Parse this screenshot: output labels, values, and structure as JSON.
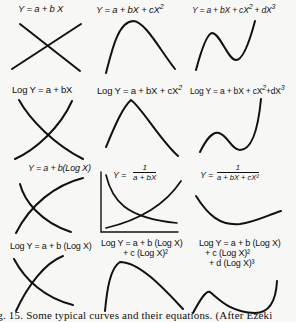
{
  "figure": {
    "caption": "ig. 15.  Some typical curves and their equations.  (After Ezeki",
    "rows": [
      {
        "panels": [
          {
            "equation": "Y = a + b X"
          },
          {
            "equation": "Y = a + bX + cX²"
          },
          {
            "equation": "Y = a + bX + cX² + dX³"
          }
        ]
      },
      {
        "panels": [
          {
            "equation": "Log Y = a + bX"
          },
          {
            "equation": "Log Y = a + bX + cX²"
          },
          {
            "equation": "Log Y = a + bX + cX² + dX³"
          }
        ]
      },
      {
        "panels": [
          {
            "equation": "Y = a + b(Log X)"
          },
          {
            "equation": "Y = 1 / (a + bX)",
            "numerator": "1",
            "denominator": "a + bX"
          },
          {
            "equation": "Y = 1 / (a + bX + cX²)",
            "numerator": "1",
            "denominator": "a + bX + cX²"
          }
        ]
      },
      {
        "panels": [
          {
            "equation": "Log Y = a + b (Log X)"
          },
          {
            "equation": "Log Y = a + b (Log X) + c (Log X)²",
            "line1": "Log Y = a + b (Log X)",
            "line2": "+ c (Log X)²"
          },
          {
            "equation": "Log Y = a + b (Log X) + c (Log X)² + d (Log X)³",
            "line1": "Log Y = a + b (Log X)",
            "line2": "+ c (Log X)²",
            "line3": "+ d (Log X)³"
          }
        ]
      }
    ]
  },
  "labels": {
    "r1p1": "Y = a + b  X",
    "r1p2": "Y = a + bX + cX",
    "r1p2_exp": "2",
    "r1p3": "Y = a + bX + cX",
    "r1p3_exp1": "2",
    "r1p3_mid": " + dX",
    "r1p3_exp2": "3",
    "r2p1": "Log Y = a + bX",
    "r2p2": "Log Y = a + bX + cX",
    "r2p2_exp": "2",
    "r2p3": "Log Y = a + bX + cX",
    "r2p3_exp1": "2",
    "r2p3_mid": "+dX",
    "r2p3_exp2": "3",
    "r3p1": "Y = a + b(Log X)",
    "r3p2_prefix": "Y =",
    "r3p2_num": "1",
    "r3p2_den": "a + bX",
    "r3p3_prefix": "Y =",
    "r3p3_num": "1",
    "r3p3_den": "a + bX + cX²",
    "r4p1": "Log Y = a + b (Log X)",
    "r4p2_l1": "Log Y = a + b (Log X)",
    "r4p2_l2": "+ c (Log X)²",
    "r4p3_l1": "Log Y = a + b (Log X)",
    "r4p3_l2": "+ c (Log X)²",
    "r4p3_l3": "+ d (Log X)³"
  }
}
